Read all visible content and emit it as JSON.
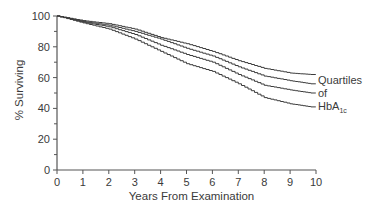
{
  "chart_data": {
    "type": "line",
    "title": "",
    "xlabel": "Years From Examination",
    "ylabel": "% Surviving",
    "xlim": [
      0,
      10
    ],
    "ylim": [
      0,
      100
    ],
    "x_ticks": [
      "0",
      "1",
      "2",
      "3",
      "4",
      "5",
      "6",
      "7",
      "8",
      "9",
      "10"
    ],
    "y_ticks": [
      "0",
      "20",
      "40",
      "60",
      "80",
      "100"
    ],
    "y_minor_step": 10,
    "grid": false,
    "annotation": {
      "lines": [
        "Quartiles",
        "of",
        "HbA"
      ],
      "subscript": "1c",
      "placement": "right of curve ends"
    },
    "x": [
      0,
      1,
      2,
      3,
      4,
      5,
      6,
      7,
      8,
      9,
      9.8
    ],
    "series": [
      {
        "name": "Quartile 1",
        "values": [
          100,
          97,
          95,
          91.5,
          86,
          82,
          77,
          71,
          66,
          63,
          62
        ]
      },
      {
        "name": "Quartile 2",
        "values": [
          100,
          96.5,
          94,
          90,
          85,
          79,
          74,
          67,
          61,
          58,
          56
        ]
      },
      {
        "name": "Quartile 3",
        "values": [
          100,
          96,
          93,
          88,
          81,
          75,
          70,
          62,
          55,
          52,
          50
        ]
      },
      {
        "name": "Quartile 4",
        "values": [
          100,
          95.5,
          91.5,
          85,
          77,
          69,
          64,
          56,
          47,
          43,
          41
        ]
      }
    ]
  }
}
